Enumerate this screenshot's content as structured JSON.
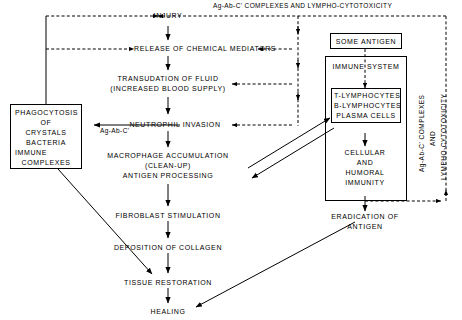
{
  "diagram": {
    "title_label": "Ag-Ab-C' COMPLEXES  AND  LYMPHO-CYTOTOXICITY",
    "side_label_line1": "Ag-Ab-C' COMPLEXES",
    "side_label_line2": "AND",
    "side_label_line3": "LYMPHO-CYTOTOXICITY",
    "complex_edge_label": "Ag-Ab-C'"
  },
  "nodes": {
    "injury": {
      "line1": "INJURY"
    },
    "release": {
      "line1": "RELEASE  OF  CHEMICAL  MEDIATORS"
    },
    "transudation": {
      "line1": "TRANSUDATION  OF  FLUID",
      "line2": "(INCREASED  BLOOD  SUPPLY)"
    },
    "neutrophil": {
      "line1": "NEUTROPHIL  INVASION"
    },
    "macrophage": {
      "line1": "MACROPHAGE  ACCUMULATION",
      "line2": "(CLEAN-UP)",
      "line3": "ANTIGEN  PROCESSING"
    },
    "fibroblast": {
      "line1": "FIBROBLAST  STIMULATION"
    },
    "collagen": {
      "line1": "DEPOSITION  OF  COLLAGEN"
    },
    "tissue": {
      "line1": "TISSUE  RESTORATION"
    },
    "healing": {
      "line1": "HEALING"
    },
    "phagocytosis": {
      "line1": "PHAGOCYTOSIS",
      "line2": "OF",
      "line3": "CRYSTALS",
      "line4": "BACTERIA",
      "line5": "IMMUNE",
      "line6": "COMPLEXES"
    },
    "some_antigen": {
      "line1": "SOME  ANTIGEN"
    },
    "immune_system": {
      "line1": "IMMUNE  SYSTEM"
    },
    "lymphocytes": {
      "line1": "T-LYMPHOCYTES",
      "line2": "B-LYMPHOCYTES",
      "line3": "PLASMA   CELLS"
    },
    "immunity": {
      "line1": "CELLULAR",
      "line2": "AND",
      "line3": "HUMORAL",
      "line4": "IMMUNITY"
    },
    "eradication": {
      "line1": "ERADICATION  OF",
      "line2": "ANTIGEN"
    }
  }
}
